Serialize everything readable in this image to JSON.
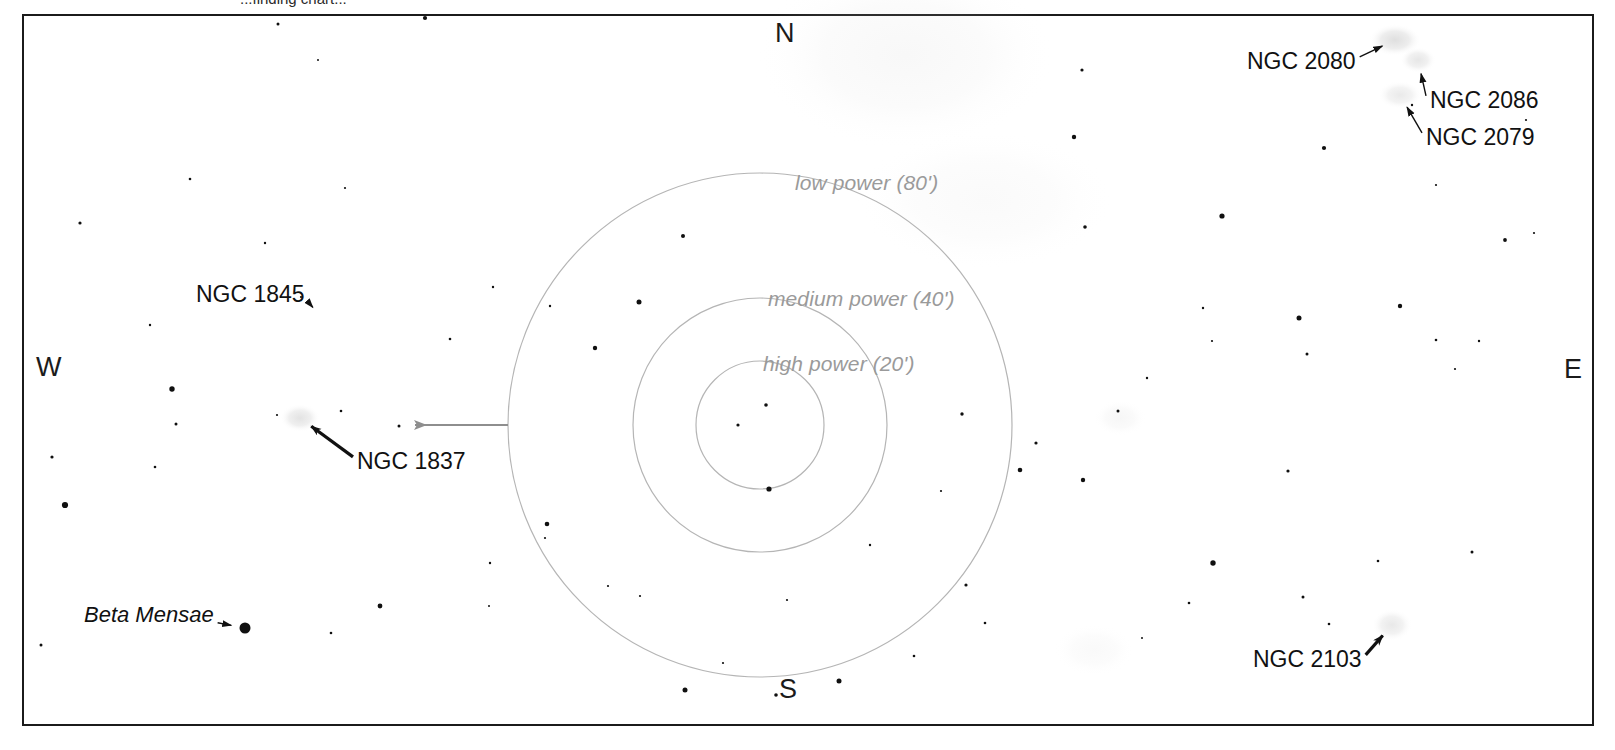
{
  "chart_data": {
    "type": "scatter",
    "cut_off_caption": "...finding chart...",
    "xlabel": "",
    "ylabel": "",
    "grid": false,
    "legend_position": "none",
    "compass": {
      "north": "N",
      "south": "S",
      "east": "E",
      "west": "W"
    },
    "fov_circles": [
      {
        "id": "low",
        "label": "low power (80')",
        "arcmin": 80,
        "radius_px": 252,
        "cx": 760,
        "cy": 425,
        "label_x": 795,
        "label_y": 172,
        "color": "#b5b5b5"
      },
      {
        "id": "medium",
        "label": "medium power (40')",
        "arcmin": 40,
        "radius_px": 127,
        "cx": 760,
        "cy": 425,
        "label_x": 768,
        "label_y": 288,
        "color": "#b5b5b5"
      },
      {
        "id": "high",
        "label": "high power (20')",
        "arcmin": 20,
        "radius_px": 64,
        "cx": 760,
        "cy": 425,
        "label_x": 763,
        "label_y": 353,
        "color": "#b5b5b5"
      }
    ],
    "objects": [
      {
        "name": "NGC 2080",
        "label_x": 1247,
        "label_y": 50,
        "target_x": 1395,
        "target_y": 40,
        "kind": "nebula"
      },
      {
        "name": "NGC 2086",
        "label_x": 1430,
        "label_y": 89,
        "target_x": 1418,
        "target_y": 60,
        "kind": "nebula"
      },
      {
        "name": "NGC 2079",
        "label_x": 1426,
        "label_y": 126,
        "target_x": 1400,
        "target_y": 95,
        "kind": "nebula"
      },
      {
        "name": "NGC 1845",
        "label_x": 196,
        "label_y": 283,
        "target_x": 322,
        "target_y": 318,
        "kind": "cluster"
      },
      {
        "name": "NGC 1837",
        "label_x": 357,
        "label_y": 450,
        "target_x": 300,
        "target_y": 418,
        "kind": "nebula"
      },
      {
        "name": "NGC 2103",
        "label_x": 1253,
        "label_y": 648,
        "target_x": 1392,
        "target_y": 625,
        "kind": "nebula"
      },
      {
        "name": "Beta Mensae",
        "label_x": 84,
        "label_y": 604,
        "target_x": 245,
        "target_y": 628,
        "kind": "star",
        "italic": true
      }
    ],
    "fov_pointer": {
      "description": "grey leader line from low-power circle to NGC 1837 area",
      "from_x": 508,
      "from_y": 425,
      "to_x": 415,
      "to_y": 425,
      "color": "#8e8e8e"
    },
    "colors": {
      "background": "#ffffff",
      "frame": "#1b1b1b",
      "star": "#101010",
      "fov_circle": "#b5b5b5",
      "fov_label": "#9a9a9a",
      "object_label": "#111111",
      "leader_arrow": "#111111",
      "grey_arrow": "#8e8e8e",
      "nebula": "#d9d9d9"
    },
    "stars": [
      [
        278,
        24,
        3.0
      ],
      [
        425,
        18,
        4.2
      ],
      [
        1082,
        70,
        3.2
      ],
      [
        1412,
        105,
        2.4
      ],
      [
        1526,
        120,
        2.2
      ],
      [
        1324,
        148,
        4.2
      ],
      [
        1074,
        137,
        4.4
      ],
      [
        318,
        60,
        2.0
      ],
      [
        190,
        179,
        2.6
      ],
      [
        345,
        188,
        2.2
      ],
      [
        80,
        223,
        3.2
      ],
      [
        1222,
        216,
        5.2
      ],
      [
        1085,
        227,
        3.6
      ],
      [
        1436,
        185,
        2.2
      ],
      [
        1505,
        240,
        3.8
      ],
      [
        1534,
        233,
        2.2
      ],
      [
        150,
        325,
        2.4
      ],
      [
        265,
        243,
        2.4
      ],
      [
        301,
        297,
        2.2
      ],
      [
        450,
        339,
        2.6
      ],
      [
        493,
        287,
        2.4
      ],
      [
        683,
        236,
        4.0
      ],
      [
        639,
        302,
        5.0
      ],
      [
        595,
        348,
        4.4
      ],
      [
        550,
        306,
        2.4
      ],
      [
        172,
        389,
        5.4
      ],
      [
        176,
        424,
        3.0
      ],
      [
        52,
        457,
        3.2
      ],
      [
        65,
        505,
        6.2
      ],
      [
        155,
        467,
        2.6
      ],
      [
        277,
        415,
        2.2
      ],
      [
        341,
        411,
        2.6
      ],
      [
        399,
        426,
        3.0
      ],
      [
        1299,
        318,
        5.0
      ],
      [
        1400,
        306,
        4.4
      ],
      [
        1203,
        308,
        2.4
      ],
      [
        1436,
        340,
        2.6
      ],
      [
        1307,
        354,
        3.0
      ],
      [
        1479,
        341,
        2.4
      ],
      [
        1212,
        341,
        2.2
      ],
      [
        1455,
        369,
        2.2
      ],
      [
        738,
        425,
        3.2
      ],
      [
        766,
        405,
        3.6
      ],
      [
        769,
        489,
        5.2
      ],
      [
        1036,
        443,
        3.2
      ],
      [
        1020,
        470,
        4.6
      ],
      [
        1083,
        480,
        4.4
      ],
      [
        962,
        414,
        3.4
      ],
      [
        941,
        491,
        2.2
      ],
      [
        1288,
        471,
        3.2
      ],
      [
        547,
        524,
        4.6
      ],
      [
        545,
        538,
        2.2
      ],
      [
        490,
        563,
        2.4
      ],
      [
        608,
        586,
        2.2
      ],
      [
        640,
        596,
        2.2
      ],
      [
        1213,
        563,
        5.4
      ],
      [
        1378,
        561,
        2.6
      ],
      [
        1472,
        552,
        3.0
      ],
      [
        1303,
        597,
        3.0
      ],
      [
        1189,
        603,
        2.6
      ],
      [
        1329,
        624,
        2.6
      ],
      [
        380,
        606,
        4.8
      ],
      [
        331,
        633,
        2.6
      ],
      [
        245,
        628,
        11.0
      ],
      [
        41,
        645,
        3.0
      ],
      [
        685,
        690,
        5.0
      ],
      [
        776,
        695,
        3.6
      ],
      [
        839,
        681,
        5.0
      ],
      [
        966,
        585,
        3.2
      ],
      [
        985,
        623,
        2.6
      ],
      [
        914,
        656,
        2.6
      ],
      [
        787,
        600,
        2.2
      ],
      [
        870,
        545,
        2.4
      ],
      [
        723,
        663,
        2.2
      ],
      [
        489,
        606,
        2.0
      ],
      [
        1142,
        638,
        2.0
      ],
      [
        1118,
        411,
        3.0
      ],
      [
        1147,
        378,
        2.4
      ]
    ],
    "nebulae": [
      [
        1395,
        40,
        26,
        16,
        0.45
      ],
      [
        1418,
        60,
        18,
        13,
        0.35
      ],
      [
        1400,
        95,
        22,
        14,
        0.3
      ],
      [
        300,
        418,
        20,
        14,
        0.4
      ],
      [
        1392,
        625,
        20,
        16,
        0.32
      ],
      [
        905,
        55,
        150,
        95,
        0.1
      ],
      [
        985,
        200,
        130,
        70,
        0.07
      ],
      [
        1120,
        418,
        26,
        18,
        0.12
      ],
      [
        1094,
        650,
        40,
        26,
        0.08
      ]
    ]
  }
}
